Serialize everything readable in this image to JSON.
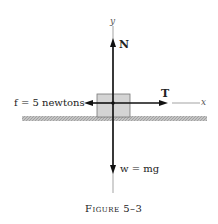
{
  "figure": {
    "caption": "Figure 5–3",
    "axes": {
      "x_label": "x",
      "y_label": "y"
    },
    "forces": {
      "normal": "N",
      "tension": "T",
      "friction": "f = 5 newtons",
      "weight": "w = mg"
    },
    "colors": {
      "block": "#d4d4d4",
      "ground": "#b8b8b8",
      "ink": "#222222"
    }
  }
}
